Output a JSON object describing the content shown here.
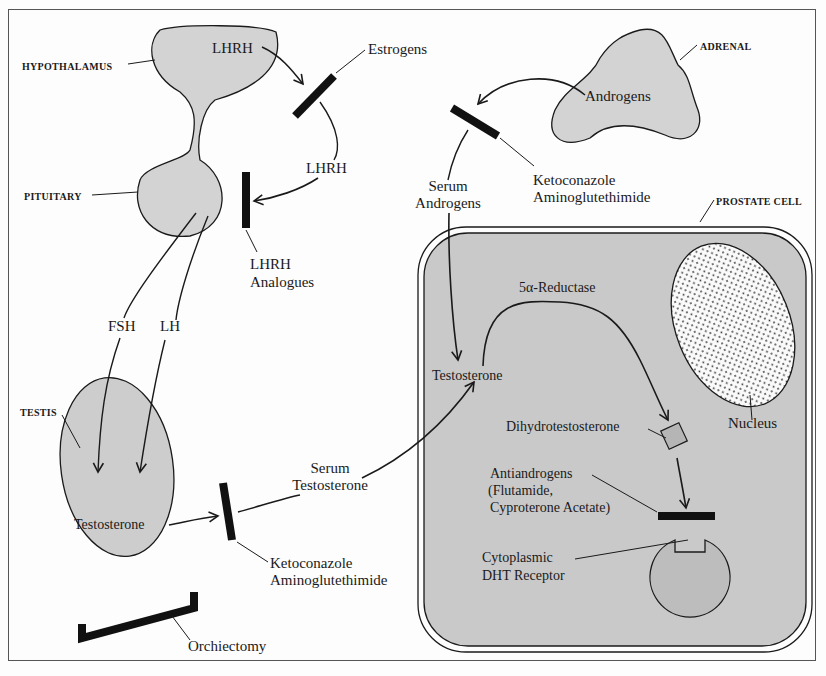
{
  "diagram": {
    "organ_labels": {
      "hypothalamus": "HYPOTHALAMUS",
      "pituitary": "PITUITARY",
      "testis": "TESTIS",
      "adrenal": "ADRENAL",
      "prostate_cell": "PROSTATE CELL"
    },
    "hormones": {
      "lhrh_top": "LHRH",
      "lhrh_mid": "LHRH",
      "fsh": "FSH",
      "lh": "LH",
      "testis_testosterone": "Testosterone",
      "serum_testosterone_1": "Serum",
      "serum_testosterone_2": "Testosterone",
      "adrenal_androgens": "Androgens",
      "serum_androgens_1": "Serum",
      "serum_androgens_2": "Androgens",
      "cell_testosterone": "Testosterone",
      "enzyme": "5α-Reductase",
      "dht": "Dihydrotestosterone",
      "nucleus": "Nucleus"
    },
    "blockers": {
      "estrogens": "Estrogens",
      "lhrh_analogues_1": "LHRH",
      "lhrh_analogues_2": "Analogues",
      "adrenal_block_1": "Ketoconazole",
      "adrenal_block_2": "Aminoglutethimide",
      "testis_block_1": "Ketoconazole",
      "testis_block_2": "Aminoglutethimide",
      "orchiectomy": "Orchiectomy",
      "antiandrogens_1": "Antiandrogens",
      "antiandrogens_2": "(Flutamide,",
      "antiandrogens_3": "Cyproterone Acetate)",
      "receptor_1": "Cytoplasmic",
      "receptor_2": "DHT Receptor"
    },
    "colors": {
      "organ_fill": "#cfcfcf",
      "cell_fill": "#c9c9c9",
      "stroke": "#1a1a1a",
      "blocker": "#111111"
    }
  }
}
